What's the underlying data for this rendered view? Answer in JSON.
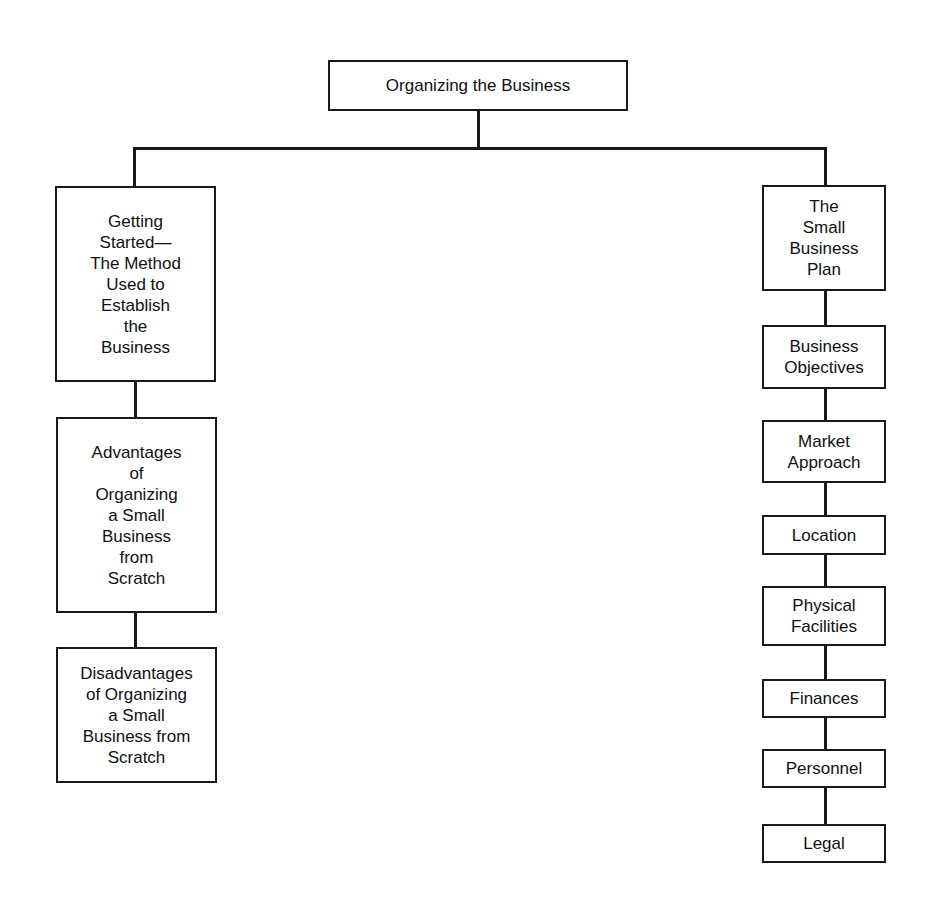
{
  "root": {
    "label": "Organizing the Business"
  },
  "left_branch": [
    {
      "label": "Getting\nStarted—\nThe Method\nUsed to\nEstablish\nthe\nBusiness"
    },
    {
      "label": "Advantages\nof\nOrganizing\na Small\nBusiness\nfrom\nScratch"
    },
    {
      "label": "Disadvantages\nof Organizing\na Small\nBusiness from\nScratch"
    }
  ],
  "right_branch": [
    {
      "label": "The\nSmall\nBusiness\nPlan"
    },
    {
      "label": "Business\nObjectives"
    },
    {
      "label": "Market\nApproach"
    },
    {
      "label": "Location"
    },
    {
      "label": "Physical\nFacilities"
    },
    {
      "label": "Finances"
    },
    {
      "label": "Personnel"
    },
    {
      "label": "Legal"
    }
  ]
}
